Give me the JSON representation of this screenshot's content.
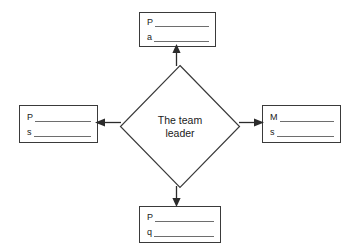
{
  "diagram": {
    "type": "spider-web-diagram",
    "center": {
      "label": "The team\nleader",
      "line1": "The team",
      "line2": "leader",
      "shape": "diamond"
    },
    "boxes": [
      {
        "position": "top",
        "name": "answer-box-top",
        "lines": [
          {
            "prefix": "P",
            "value": ""
          },
          {
            "prefix": "a",
            "value": ""
          }
        ]
      },
      {
        "position": "left",
        "name": "answer-box-left",
        "lines": [
          {
            "prefix": "P",
            "value": ""
          },
          {
            "prefix": "s",
            "value": ""
          }
        ]
      },
      {
        "position": "right",
        "name": "answer-box-right",
        "lines": [
          {
            "prefix": "M",
            "value": ""
          },
          {
            "prefix": "s",
            "value": ""
          }
        ]
      },
      {
        "position": "bottom",
        "name": "answer-box-bottom",
        "lines": [
          {
            "prefix": "P",
            "value": ""
          },
          {
            "prefix": "q",
            "value": ""
          }
        ]
      }
    ],
    "connectors": [
      {
        "name": "connector-top",
        "direction": "up"
      },
      {
        "name": "connector-right",
        "direction": "right"
      },
      {
        "name": "connector-bottom",
        "direction": "down"
      },
      {
        "name": "connector-left",
        "direction": "left"
      }
    ],
    "colors": {
      "stroke": "#3a3a3a",
      "rule": "#6e6e6e",
      "text": "#1a1a1a",
      "background": "#ffffff"
    }
  }
}
